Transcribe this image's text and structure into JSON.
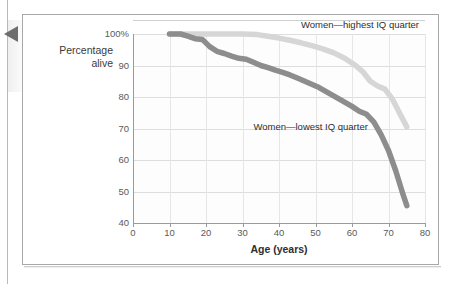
{
  "page": {
    "marker_icon": "left-triangle-marker"
  },
  "chart_data": {
    "type": "line",
    "title": "",
    "xlabel": "Age (years)",
    "ylabel": "Percentage\nalive",
    "ylabel_line1": "Percentage",
    "ylabel_line2": "alive",
    "xlim": [
      0,
      80
    ],
    "ylim": [
      40,
      100
    ],
    "grid": true,
    "legend_position": "inline-annotations",
    "xticks": [
      "0",
      "10",
      "20",
      "30",
      "40",
      "50",
      "60",
      "70",
      "80"
    ],
    "xtick_values": [
      0,
      10,
      20,
      30,
      40,
      50,
      60,
      70,
      80
    ],
    "yticks": [
      "100%",
      "90",
      "80",
      "70",
      "60",
      "50",
      "40"
    ],
    "ytick_values": [
      100,
      90,
      80,
      70,
      60,
      50,
      40
    ],
    "colors": {
      "highest_iq": "#d6d6d6",
      "lowest_iq": "#8d8d8d",
      "grid": "#dddddd",
      "axis": "#9a9a9a",
      "frame": "#a8a8a8",
      "text": "#2e2e2e",
      "marker": "#6d6d6d"
    },
    "series": [
      {
        "name": "Women—highest IQ quarter",
        "color": "#d6d6d6",
        "annotation_x": 46,
        "annotation_y": 103,
        "x": [
          10,
          15,
          20,
          25,
          30,
          34,
          37,
          40,
          43,
          46,
          49,
          52,
          55,
          58,
          61,
          63,
          65,
          67,
          69,
          71,
          73,
          75
        ],
        "y": [
          100,
          100,
          100,
          100,
          100,
          99.8,
          99.3,
          98.7,
          98.0,
          97.2,
          96.3,
          95.3,
          94.0,
          92.3,
          90.0,
          88.0,
          85.0,
          83.5,
          82.5,
          79.5,
          75.0,
          70.5
        ]
      },
      {
        "name": "Women—lowest IQ quarter",
        "color": "#8d8d8d",
        "annotation_x": 33,
        "annotation_y": 70.5,
        "x": [
          10,
          13,
          15,
          17,
          19,
          21,
          23,
          25,
          27,
          29,
          31,
          33,
          35,
          37,
          39,
          41,
          43,
          45,
          48,
          51,
          54,
          57,
          60,
          62,
          64,
          66,
          68,
          70,
          72,
          74,
          75
        ],
        "y": [
          100,
          100,
          99.3,
          98.5,
          98.3,
          96.0,
          94.5,
          93.8,
          93.0,
          92.3,
          92.0,
          91.0,
          90.0,
          89.3,
          88.5,
          87.8,
          87.0,
          86.0,
          84.5,
          83.0,
          81.0,
          79.0,
          77.0,
          75.5,
          74.5,
          72.0,
          68.0,
          63.0,
          56.5,
          49.0,
          45.5
        ]
      }
    ]
  }
}
